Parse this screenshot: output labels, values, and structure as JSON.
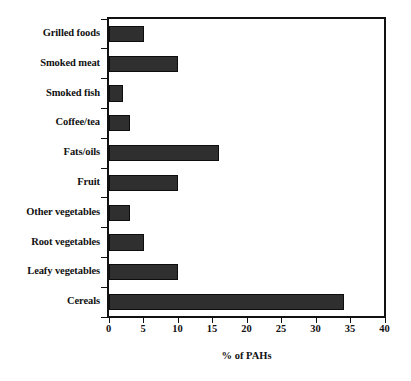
{
  "chart_data": {
    "type": "bar",
    "orientation": "horizontal",
    "title": "",
    "xlabel": "% of PAHs",
    "ylabel": "",
    "xlim": [
      0,
      40
    ],
    "xticks": [
      0,
      5,
      10,
      15,
      20,
      25,
      30,
      35,
      40
    ],
    "grid": false,
    "legend": null,
    "categories": [
      "Grilled foods",
      "Smoked meat",
      "Smoked fish",
      "Coffee/tea",
      "Fats/oils",
      "Fruit",
      "Other vegetables",
      "Root vegetables",
      "Leafy vegetables",
      "Cereals"
    ],
    "values": [
      5,
      10,
      2,
      3,
      16,
      10,
      3,
      5,
      10,
      34
    ],
    "bar_color": "#2f2f2f",
    "bar_edge_color": "#0d0d0d",
    "axis_color": "#111111",
    "background_color": "#ffffff"
  }
}
